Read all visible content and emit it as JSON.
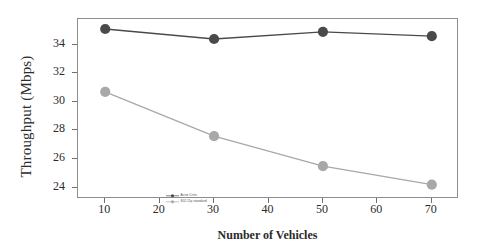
{
  "chart_data": {
    "type": "line",
    "title": "",
    "xlabel": "Number of Vehicles",
    "ylabel": "Throughput (Mbps)",
    "x": [
      10,
      30,
      50,
      70
    ],
    "xlim": [
      5,
      75
    ],
    "ylim": [
      23.2,
      35.8
    ],
    "xticks": [
      10,
      20,
      30,
      40,
      50,
      60,
      70
    ],
    "yticks": [
      24,
      26,
      28,
      30,
      32,
      34
    ],
    "grid": false,
    "legend_position": "lower left inside axes",
    "series": [
      {
        "name": "Actor Critic",
        "color": "#4a4a4a",
        "marker": "circle",
        "values": [
          35.1,
          34.4,
          34.9,
          34.6
        ]
      },
      {
        "name": "802.11p standard",
        "color": "#a8a8a8",
        "marker": "circle",
        "values": [
          30.7,
          27.6,
          25.5,
          24.2
        ]
      }
    ]
  },
  "axes": {
    "frame_color": "#8d8d8d",
    "tick_color": "#6f6f6f",
    "background": "#ffffff"
  }
}
